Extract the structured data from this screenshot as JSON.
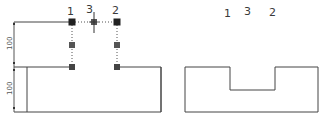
{
  "left_view": {
    "point_labels": [
      "1",
      "3",
      "2"
    ],
    "dimensions": [
      {
        "label": "100",
        "span": "upper"
      },
      {
        "label": "100",
        "span": "lower"
      }
    ],
    "grip_color": "#333333",
    "grip_mid_color": "#555555",
    "line_color": "#444444",
    "hidden_line_style": "dotted"
  },
  "right_view": {
    "point_labels": [
      "1",
      "3",
      "2"
    ],
    "line_color": "#444444"
  }
}
